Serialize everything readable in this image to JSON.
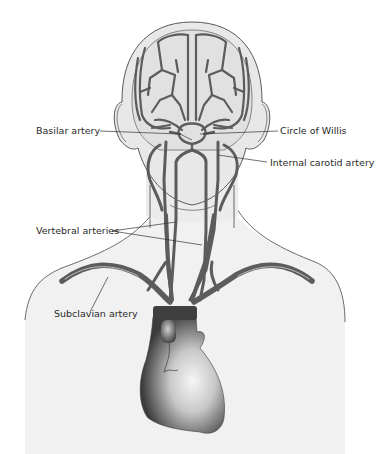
{
  "diagram": {
    "colors": {
      "background": "#ffffff",
      "head_fill": "#e9e9e9",
      "brain_fill": "#e2e2e2",
      "outline": "#5a5a5a",
      "artery": "#5c5c5c",
      "leader_line": "#333333",
      "label_text": "#2a2a2a",
      "heart_dark": "#3c3c3c",
      "heart_light": "#f4f4f4"
    },
    "labels": {
      "basilar": "Basilar artery",
      "circle_willis": "Circle of Willis",
      "internal_carotid": "Internal carotid artery",
      "vertebral": "Vertebral arteries",
      "subclavian": "Subclavian artery"
    }
  }
}
